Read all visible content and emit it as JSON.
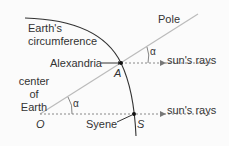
{
  "diagram": {
    "labels": {
      "circumference": [
        "Earth's",
        "circumference"
      ],
      "pole": "Pole",
      "alexandria": "Alexandria",
      "point_a": "A",
      "center": [
        "center",
        "of",
        "Earth"
      ],
      "point_o": "O",
      "syene": "Syene",
      "point_s": "S",
      "rays_top": "sun's rays",
      "rays_bottom": "sun's rays",
      "alpha_top": "α",
      "alpha_bottom": "α"
    },
    "colors": {
      "arc": "#333333",
      "pole_line": "#bbbbbb",
      "rays": "#888888",
      "text": "#333333",
      "background": "#fbfbfb"
    }
  }
}
